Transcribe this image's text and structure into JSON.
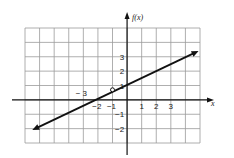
{
  "chart_data": {
    "type": "line",
    "title": "",
    "xlabel": "x",
    "ylabel": "f(x)",
    "grid": true,
    "xlim": [
      -7,
      5
    ],
    "ylim": [
      -3,
      5
    ],
    "x_tick_labels": [
      {
        "value": -3,
        "label": "− 3"
      },
      {
        "value": -2,
        "label": "−2"
      },
      {
        "value": -1,
        "label": "−1"
      },
      {
        "value": 1,
        "label": "1"
      },
      {
        "value": 2,
        "label": "2"
      },
      {
        "value": 3,
        "label": "3"
      }
    ],
    "y_tick_labels": [
      {
        "value": 3,
        "label": "3"
      },
      {
        "value": 2,
        "label": "2"
      },
      {
        "value": 1,
        "label": "1"
      },
      {
        "value": -1,
        "label": "−1"
      },
      {
        "value": -2,
        "label": "−2"
      }
    ],
    "series": [
      {
        "name": "f(x)",
        "style": "line with arrows at both ends",
        "start": {
          "x": -6.5,
          "y": -2.1
        },
        "end": {
          "x": 4.9,
          "y": 3.4
        },
        "y_intercept": 1.0,
        "x_intercept": -2
      }
    ],
    "annotations": [
      {
        "type": "open-circle",
        "x": -1,
        "y": 0.7
      }
    ]
  }
}
